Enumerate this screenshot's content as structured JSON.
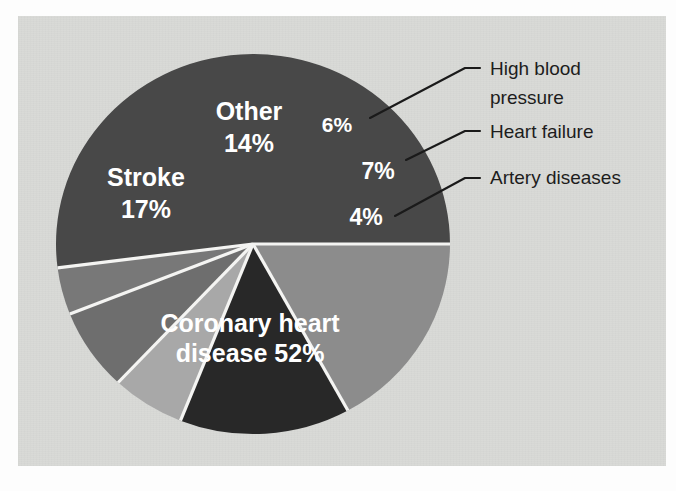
{
  "figure": {
    "background_color": "#fdfdfd",
    "panel_color": "#d9dad7",
    "separator_color": "#f4f4f2",
    "leader_line_color": "#1a1a1a",
    "callout_text_color": "#1d1d1d",
    "slice_text_color": "#ffffff"
  },
  "chart_data": {
    "type": "pie",
    "title": "",
    "subtitle": "",
    "xlabel": "",
    "ylabel": "",
    "grid": false,
    "legend_position": "callout-right",
    "units": "percent",
    "total": 100,
    "center": {
      "x": 253,
      "y": 244
    },
    "radius": {
      "rx": 197,
      "ry": 190
    },
    "start_angle_deg": 0,
    "direction": "counterclockwise",
    "categories": [
      "Coronary heart disease",
      "Artery diseases",
      "Heart failure",
      "High blood pressure",
      "Other",
      "Stroke"
    ],
    "values": [
      52,
      4,
      7,
      6,
      14,
      17
    ],
    "slices": [
      {
        "name": "Coronary heart disease",
        "value": 52,
        "value_label": "52%",
        "inside_label": "Coronary heart",
        "inside_label_line2": "disease  52%",
        "color": "#484848",
        "label_placement": "inside",
        "label_x": 250,
        "label_y": 332,
        "label_y2": 362
      },
      {
        "name": "Artery diseases",
        "value": 4,
        "value_label": "4%",
        "inside_label": "4%",
        "color": "#787878",
        "label_placement": "inside-with-callout",
        "label_x": 366,
        "label_y": 225,
        "callout_text": "Artery diseases",
        "callout_x": 490,
        "callout_y": 184,
        "anchor_x": 395,
        "anchor_y": 216,
        "elbow_x": 465,
        "elbow_y": 178
      },
      {
        "name": "Heart failure",
        "value": 7,
        "value_label": "7%",
        "inside_label": "7%",
        "color": "#6e6e6e",
        "label_placement": "inside-with-callout",
        "label_x": 378,
        "label_y": 179,
        "callout_text": "Heart failure",
        "callout_x": 490,
        "callout_y": 138,
        "anchor_x": 406,
        "anchor_y": 160,
        "elbow_x": 465,
        "elbow_y": 131
      },
      {
        "name": "High blood pressure",
        "value": 6,
        "value_label": "6%",
        "inside_label": "6%",
        "color": "#a8a8a8",
        "label_placement": "inside-with-callout",
        "label_x": 337,
        "label_y": 132,
        "callout_text": "High blood",
        "callout_text_line2": "pressure",
        "callout_x": 490,
        "callout_y": 75,
        "callout_y2": 104,
        "anchor_x": 370,
        "anchor_y": 118,
        "elbow_x": 465,
        "elbow_y": 68
      },
      {
        "name": "Other",
        "value": 14,
        "value_label": "14%",
        "inside_label": "Other",
        "inside_label_line2": "14%",
        "color": "#282828",
        "label_placement": "inside",
        "label_x": 249,
        "label_y": 120,
        "label_y2": 152
      },
      {
        "name": "Stroke",
        "value": 17,
        "value_label": "17%",
        "inside_label": "Stroke",
        "inside_label_line2": "17%",
        "color": "#8c8c8c",
        "label_placement": "inside",
        "label_x": 146,
        "label_y": 186,
        "label_y2": 218
      }
    ]
  }
}
